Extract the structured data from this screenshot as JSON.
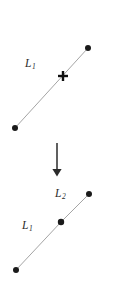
{
  "figure": {
    "kind": "line-split-diagram",
    "background_color": "#ffffff",
    "line_color": "#9a9a9a",
    "marker_color": "#1a1a1a",
    "label_color": "#2a2a2a"
  },
  "top_panel": {
    "name": "before-split",
    "line": {
      "label_text": "L",
      "label_sub": "1",
      "x1": 15,
      "y1": 128,
      "x2": 88,
      "y2": 48
    },
    "endpoints": [
      {
        "name": "lower-left-endpoint",
        "cx": 15,
        "cy": 128,
        "r": 3.0
      },
      {
        "name": "upper-right-endpoint",
        "cx": 88,
        "cy": 48,
        "r": 3.0
      }
    ],
    "split_marker": {
      "name": "split-point-cross",
      "cx": 63,
      "cy": 76,
      "arm": 5.0
    }
  },
  "transform_arrow": {
    "name": "downward-arrow",
    "x": 57,
    "y_start": 143,
    "y_end": 169,
    "head_half_width": 4.6,
    "head_height": 7.5,
    "direction": "down"
  },
  "bottom_panel": {
    "name": "after-split",
    "segment_1": {
      "label_text": "L",
      "label_sub": "1",
      "x1": 16,
      "y1": 270,
      "x2": 61,
      "y2": 222
    },
    "segment_2": {
      "label_text": "L",
      "label_sub": "2",
      "x1": 61,
      "y1": 222,
      "x2": 89,
      "y2": 194
    },
    "endpoints": [
      {
        "name": "lower-left-endpoint",
        "cx": 16,
        "cy": 270,
        "r": 3.0
      },
      {
        "name": "split-vertex-dot",
        "cx": 61,
        "cy": 222,
        "r": 3.2
      },
      {
        "name": "upper-right-endpoint",
        "cx": 89,
        "cy": 194,
        "r": 3.0
      }
    ]
  }
}
